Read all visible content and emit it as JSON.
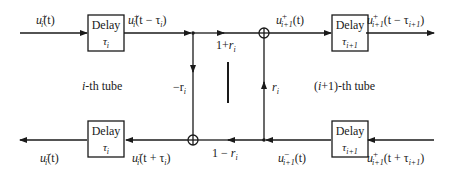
{
  "diagram": {
    "type": "signal-flow",
    "upper_path": {
      "input_label": "u_i^+(t)",
      "delay_left": {
        "title": "Delay",
        "param": "τ_i"
      },
      "after_delay_left_label": "u_i^+(t − τ_i)",
      "transmission_label": "1+r_i",
      "junction_out_label": "u_{i+1}^+(t)",
      "delay_right": {
        "title": "Delay",
        "param": "τ_{i+1}"
      },
      "output_label": "u_{i+1}^+(t − τ_{i+1})"
    },
    "lower_path": {
      "output_label": "u_i^-(t)",
      "delay_left": {
        "title": "Delay",
        "param": "τ_i"
      },
      "before_delay_left_label": "u_i^-(t + τ_i)",
      "transmission_label": "1 − r_i",
      "junction_in_label": "u_{i+1}^-(t)",
      "delay_right": {
        "title": "Delay",
        "param": "τ_{i+1}"
      },
      "input_label": "u_{i+1}^+(t + τ_{i+1})"
    },
    "reflections": {
      "left_vertical_label": "−r_i",
      "right_vertical_label": "r_i"
    },
    "region_labels": {
      "left": "i-th tube",
      "right": "(i+1)-th tube"
    }
  },
  "labels": {
    "box_title": "Delay",
    "tau_i": "τ",
    "tau_sub_i": "i",
    "tau_sub_i1": "i+1",
    "u": "u",
    "plus": "+",
    "minus": "−",
    "sub_i": "i",
    "sub_i1": "i+1",
    "arg_t": "(t)",
    "arg_t_minus_tau_i": "(t − τ",
    "arg_t_plus_tau_i": "(t + τ",
    "close_paren": ")",
    "one_plus": "1+",
    "one_minus": "1 − ",
    "r": "r",
    "neg_r": "−r",
    "tube_left_prefix": "i",
    "tube_left_suffix": "-th tube",
    "tube_right_prefix": "(",
    "tube_right_i": "i",
    "tube_right_suffix": "+1)-th tube"
  }
}
